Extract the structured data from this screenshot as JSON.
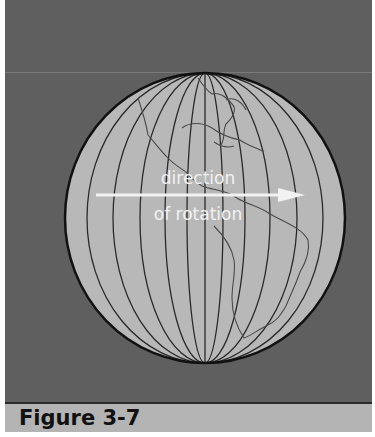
{
  "figure": {
    "caption": "Figure 3-7",
    "label_line1": "direction",
    "label_line2": "of rotation",
    "arrow_direction": "west-to-east (left to right)"
  },
  "colors": {
    "background_panel": "#5f5f5f",
    "globe_fill": "#b8b8b8",
    "meridian_lines": "#2a2a2a",
    "coastline": "#4a4a4a",
    "arrow_and_text": "#f2f2f2",
    "caption_bar": "#b4b4b4"
  }
}
